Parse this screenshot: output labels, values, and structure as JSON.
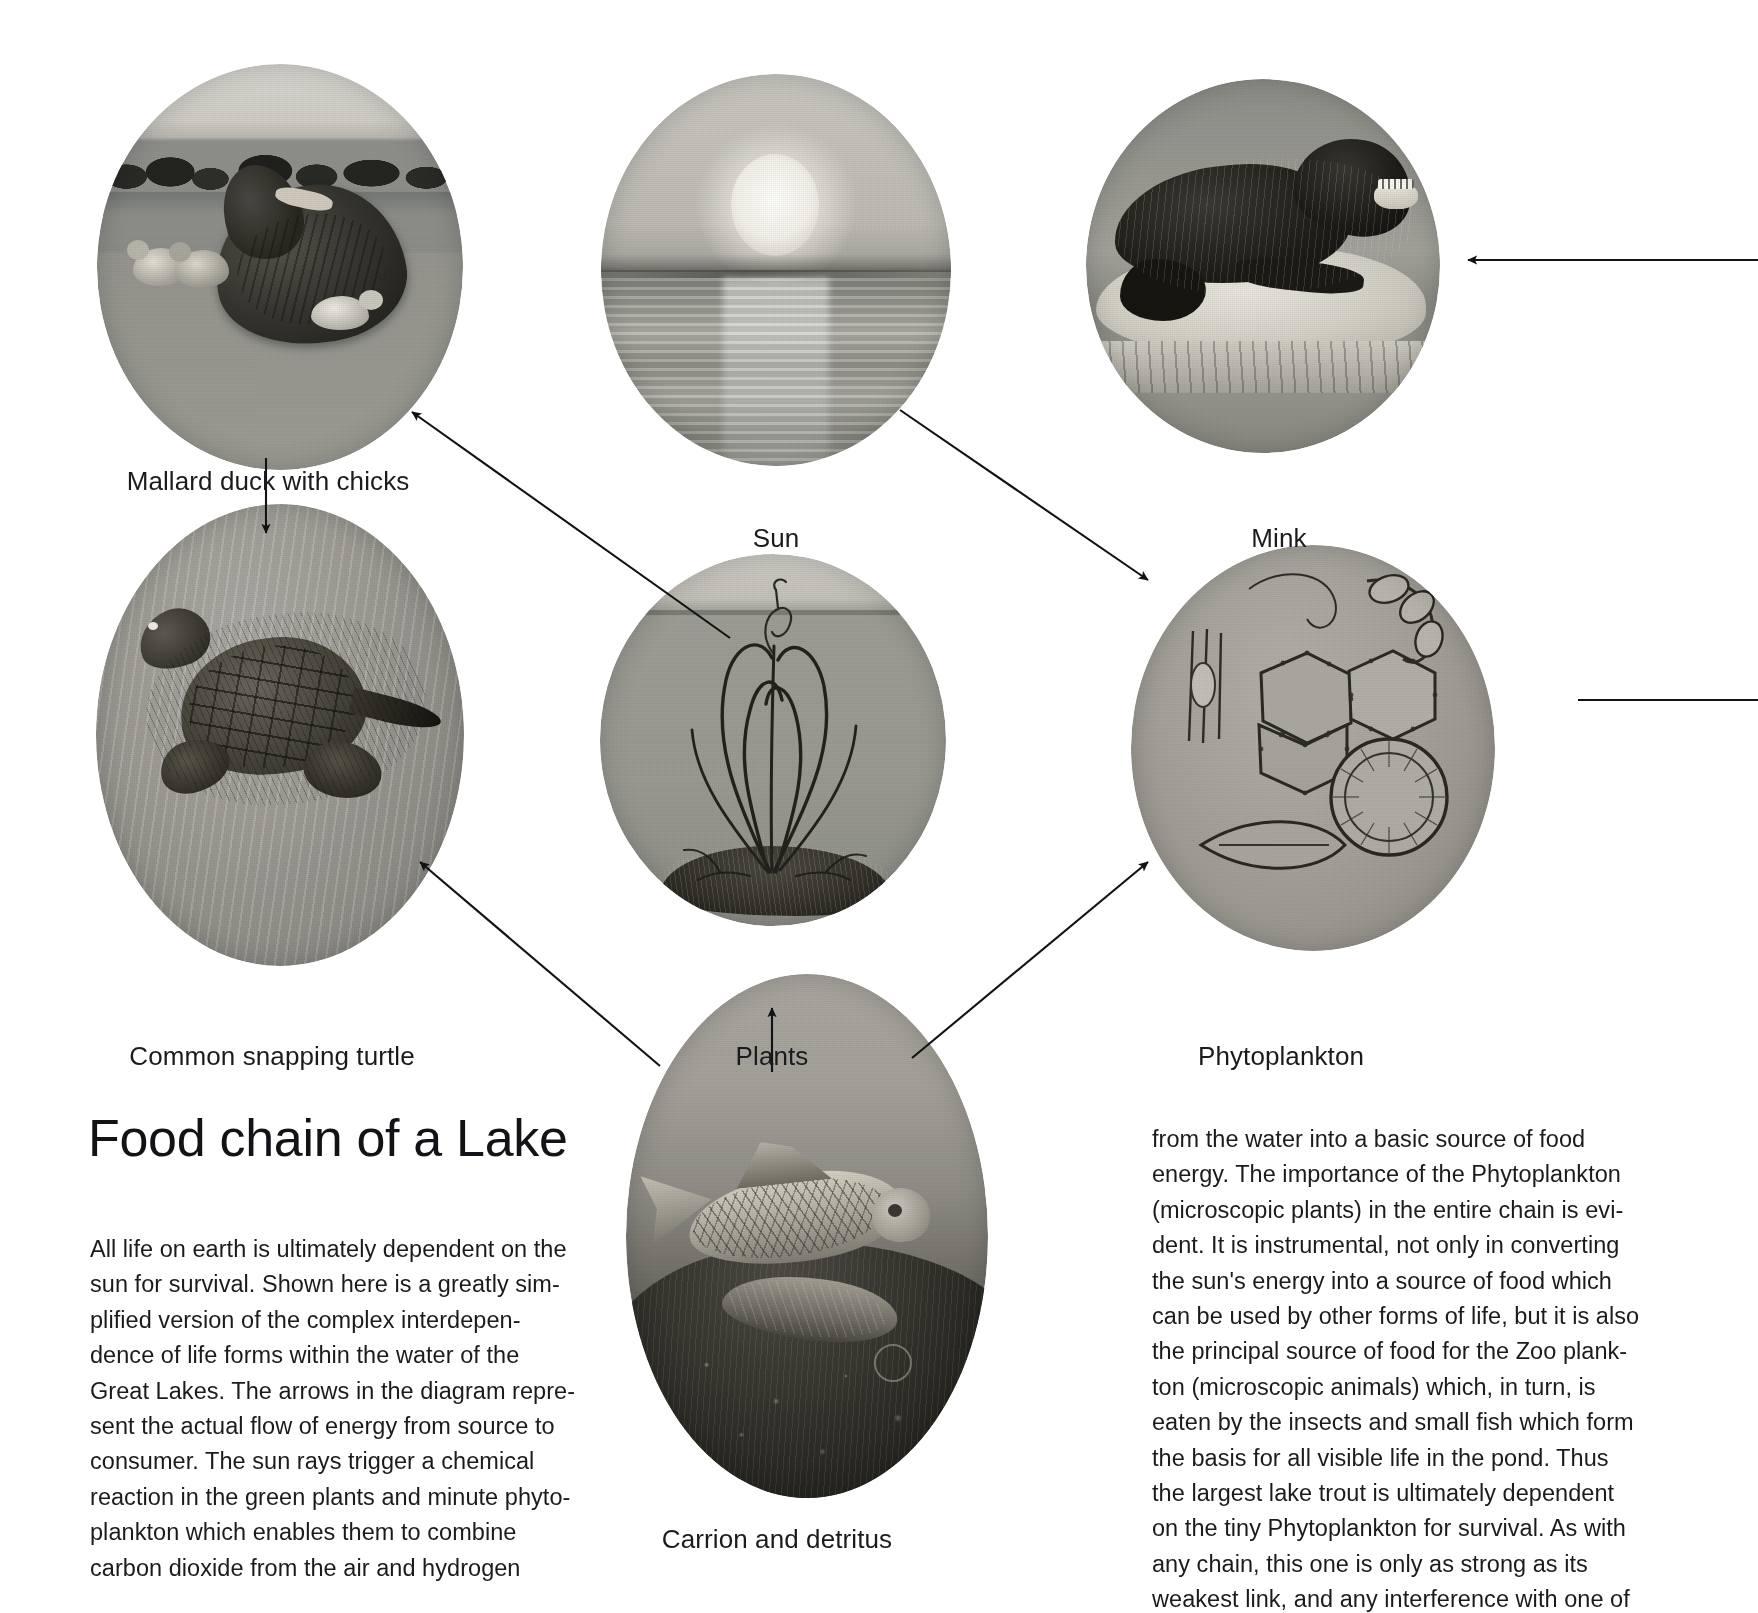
{
  "document": {
    "title": "Food chain of a Lake",
    "kind": "illustrated food-chain diagram"
  },
  "nodes": [
    {
      "id": "mallard",
      "caption": "Mallard duck with chicks",
      "subject": "mallard-duck-with-chicks-photo"
    },
    {
      "id": "sun",
      "caption": "Sun",
      "subject": "sun-over-lake-photo"
    },
    {
      "id": "mink",
      "caption": "Mink",
      "subject": "mink-on-rock-photo"
    },
    {
      "id": "turtle",
      "caption": "Common snapping turtle",
      "subject": "common-snapping-turtle-photo"
    },
    {
      "id": "plants",
      "caption": "Plants",
      "subject": "aquatic-plants-photo"
    },
    {
      "id": "phytoplankton",
      "caption": "Phytoplankton",
      "subject": "phytoplankton-microscope-photo"
    },
    {
      "id": "carrion",
      "caption": "Carrion and detritus",
      "subject": "dead-fish-carrion-photo"
    }
  ],
  "arrows": [
    {
      "from": "sun",
      "to": "mallard",
      "name": "arrow-sun-to-mallard"
    },
    {
      "from": "sun",
      "to": "phytoplankton",
      "name": "arrow-sun-to-phytoplankton"
    },
    {
      "from": "mallard",
      "to": "turtle",
      "name": "arrow-mallard-to-turtle"
    },
    {
      "from": "carrion",
      "to": "turtle",
      "name": "arrow-carrion-to-turtle"
    },
    {
      "from": "carrion",
      "to": "phytoplankton",
      "name": "arrow-carrion-to-phytoplankton"
    },
    {
      "from": "plants-below",
      "to": "plants",
      "name": "arrow-into-plants"
    },
    {
      "from": "offpage-right",
      "to": "mink",
      "name": "arrow-offpage-to-mink"
    },
    {
      "from": "offpage-right",
      "to": "phytoplankton-right",
      "name": "arrow-offpage-phytoplankton-right"
    }
  ],
  "body": {
    "left_column": [
      "All life on earth is ultimately dependent on the",
      "sun for survival. Shown here is a greatly sim-",
      "plified version of the complex interdepen-",
      "dence of life forms within the water of the",
      "Great Lakes. The arrows in the diagram repre-",
      "sent the actual flow of energy from source to",
      "consumer. The sun rays trigger a chemical",
      "reaction in the green plants and minute phyto-",
      "plankton which enables them to combine",
      "carbon dioxide from the air and hydrogen"
    ],
    "right_column": [
      "from the water into a basic source of food",
      "energy. The importance of the Phytoplankton",
      "(microscopic plants) in the entire chain is evi-",
      "dent. It is instrumental, not only in converting",
      "the sun's energy into a source of food which",
      "can be used by other forms of life, but it is also",
      "the principal source of food for the Zoo plank-",
      "ton (microscopic animals) which, in turn, is",
      "eaten by the insects and small fish which form",
      "the basis for all visible life in the pond. Thus",
      "the largest lake trout is ultimately dependent",
      "on the tiny Phytoplankton for survival. As with",
      "any chain, this one is only as strong as its",
      "weakest link, and any interference with one of"
    ]
  },
  "colors": {
    "page_background": "#ffffff",
    "ink": "#1a1b1d",
    "photo_midtone": "#9a9a98",
    "photo_shadow": "#2a2a28",
    "photo_highlight": "#e8e6e0"
  }
}
